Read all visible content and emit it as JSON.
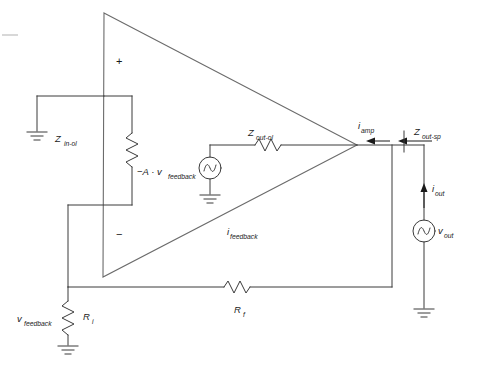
{
  "figure": {
    "kind": "circuit-schematic",
    "background_color": "#ffffff",
    "line_color": "#3a3a3a",
    "triangle_color": "#6b6b6b",
    "text_color": "#1a1a1a"
  },
  "opamp": {
    "name": "operational-amplifier",
    "plus_sign": "+",
    "minus_sign": "−",
    "apex": {
      "x": 104,
      "y": 13
    },
    "bottom": {
      "x": 103,
      "y": 277
    },
    "tip": {
      "x": 357,
      "y": 145
    }
  },
  "labels": {
    "z_in_ol": {
      "base": "Z",
      "sub": "in-ol",
      "x": 55,
      "y": 140
    },
    "z_out_ol": {
      "base": "Z",
      "sub": "out-ol",
      "x": 248,
      "y": 134
    },
    "z_out_sp": {
      "base": "Z",
      "sub": "out-sp",
      "x": 414,
      "y": 133
    },
    "gain_source": {
      "base": "−A · v",
      "sub": "feedback",
      "x": 137,
      "y": 173
    },
    "i_amp": {
      "base": "i",
      "sub": "amp",
      "x": 358,
      "y": 127
    },
    "i_out": {
      "base": "i",
      "sub": "out",
      "x": 432,
      "y": 190
    },
    "v_out": {
      "base": "v",
      "sub": "out",
      "x": 437,
      "y": 232
    },
    "i_feedback": {
      "base": "i",
      "sub": "feedback",
      "x": 227,
      "y": 233
    },
    "v_feedback": {
      "base": "v",
      "sub": "feedback",
      "x": 17,
      "y": 320
    },
    "r_i": {
      "base": "R",
      "sub": "i",
      "x": 83,
      "y": 318
    },
    "r_f": {
      "base": "R",
      "sub": "f",
      "x": 235,
      "y": 311
    }
  },
  "components": [
    {
      "name": "resistor-z-in-ol",
      "type": "resistor",
      "orientation": "vertical",
      "x": 132,
      "y": 150
    },
    {
      "name": "resistor-z-out-ol",
      "type": "resistor",
      "orientation": "horizontal",
      "x": 268,
      "y": 145
    },
    {
      "name": "resistor-r-i",
      "type": "resistor",
      "orientation": "vertical",
      "x": 68,
      "y": 318
    },
    {
      "name": "resistor-r-f",
      "type": "resistor",
      "orientation": "horizontal",
      "x": 237,
      "y": 287
    },
    {
      "name": "source-gain",
      "type": "ac-source",
      "x": 210,
      "y": 168
    },
    {
      "name": "source-v-out",
      "type": "ac-source",
      "x": 424,
      "y": 231
    }
  ],
  "grounds": [
    {
      "name": "ground-z-in-ol",
      "x": 37,
      "y": 133
    },
    {
      "name": "ground-gain-source",
      "x": 210,
      "y": 196
    },
    {
      "name": "ground-r-i",
      "x": 68,
      "y": 346
    },
    {
      "name": "ground-v-out",
      "x": 424,
      "y": 310
    }
  ],
  "arrows": [
    {
      "name": "arrow-i-amp",
      "direction": "left",
      "x": 340,
      "y": 141
    },
    {
      "name": "arrow-z-out-sp",
      "direction": "left",
      "x": 400,
      "y": 141
    },
    {
      "name": "arrow-i-out",
      "direction": "up",
      "x": 424,
      "y": 188
    }
  ]
}
